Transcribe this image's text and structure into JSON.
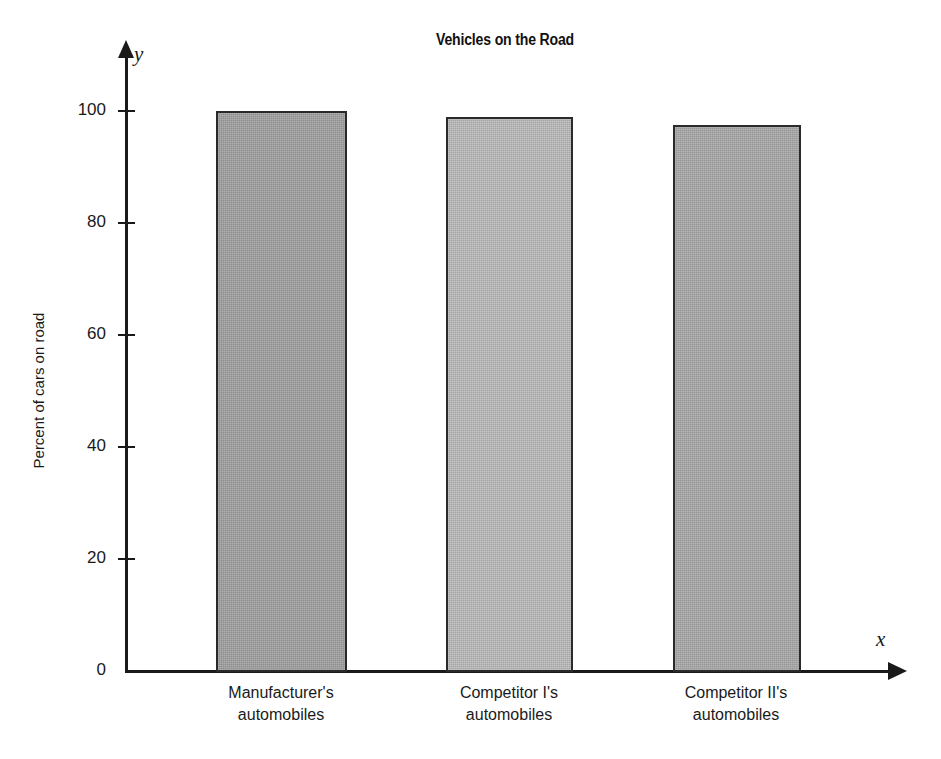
{
  "chart_data": {
    "type": "bar",
    "title": "Vehicles on the Road",
    "xlabel": "x",
    "ylabel": "Percent of cars on road",
    "y_var_symbol": "y",
    "x_var_symbol": "x",
    "categories": [
      "Manufacturer's automobiles",
      "Competitor I's automobiles",
      "Competitor II's automobiles"
    ],
    "category_lines": [
      [
        "Manufacturer's",
        "automobiles"
      ],
      [
        "Competitor I's",
        "automobiles"
      ],
      [
        "Competitor II's",
        "automobiles"
      ]
    ],
    "values": [
      100,
      99,
      97.5
    ],
    "ylim": [
      0,
      110
    ],
    "yticks": [
      0,
      20,
      40,
      60,
      80,
      100
    ],
    "ytick_labels": [
      "0",
      "20",
      "40",
      "60",
      "80",
      "100"
    ],
    "grid": false,
    "legend": "none",
    "bar_colors": [
      "#9b9b9b",
      "#b6b6b6",
      "#a4a4a4"
    ],
    "bar_edge_color": "#2a2a2a",
    "axis_color": "#1a1a1a",
    "background": "#ffffff"
  }
}
